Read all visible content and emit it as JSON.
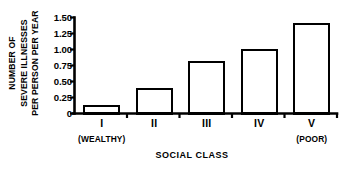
{
  "chart_data": {
    "type": "bar",
    "title": "",
    "subtitle": "",
    "xlabel": "SOCIAL CLASS",
    "ylabel_lines": [
      "NUMBER OF",
      "SEVERE ILLNESSES",
      "PER PERSON PER YEAR"
    ],
    "ylabel": "NUMBER OF SEVERE ILLNESSES PER PERSON PER YEAR",
    "categories": [
      "I",
      "II",
      "III",
      "IV",
      "V"
    ],
    "category_sublabels": [
      "(WEALTHY)",
      "",
      "",
      "",
      "(POOR)"
    ],
    "values": [
      0.12,
      0.38,
      0.81,
      0.99,
      1.4
    ],
    "ylim": [
      0,
      1.5
    ],
    "ytick_values": [
      0,
      0.25,
      0.5,
      0.75,
      1.0,
      1.25,
      1.5
    ],
    "ytick_labels": [
      "0",
      "0.25",
      "0.50",
      "0.75",
      "1.00",
      "1.25",
      "1.50"
    ],
    "grid": false,
    "legend": null,
    "legend_position": "none",
    "bar_fill_color": "#ffffff",
    "bar_edge_color": "#000000",
    "axis_color": "#000000",
    "background_color": "#ffffff"
  }
}
